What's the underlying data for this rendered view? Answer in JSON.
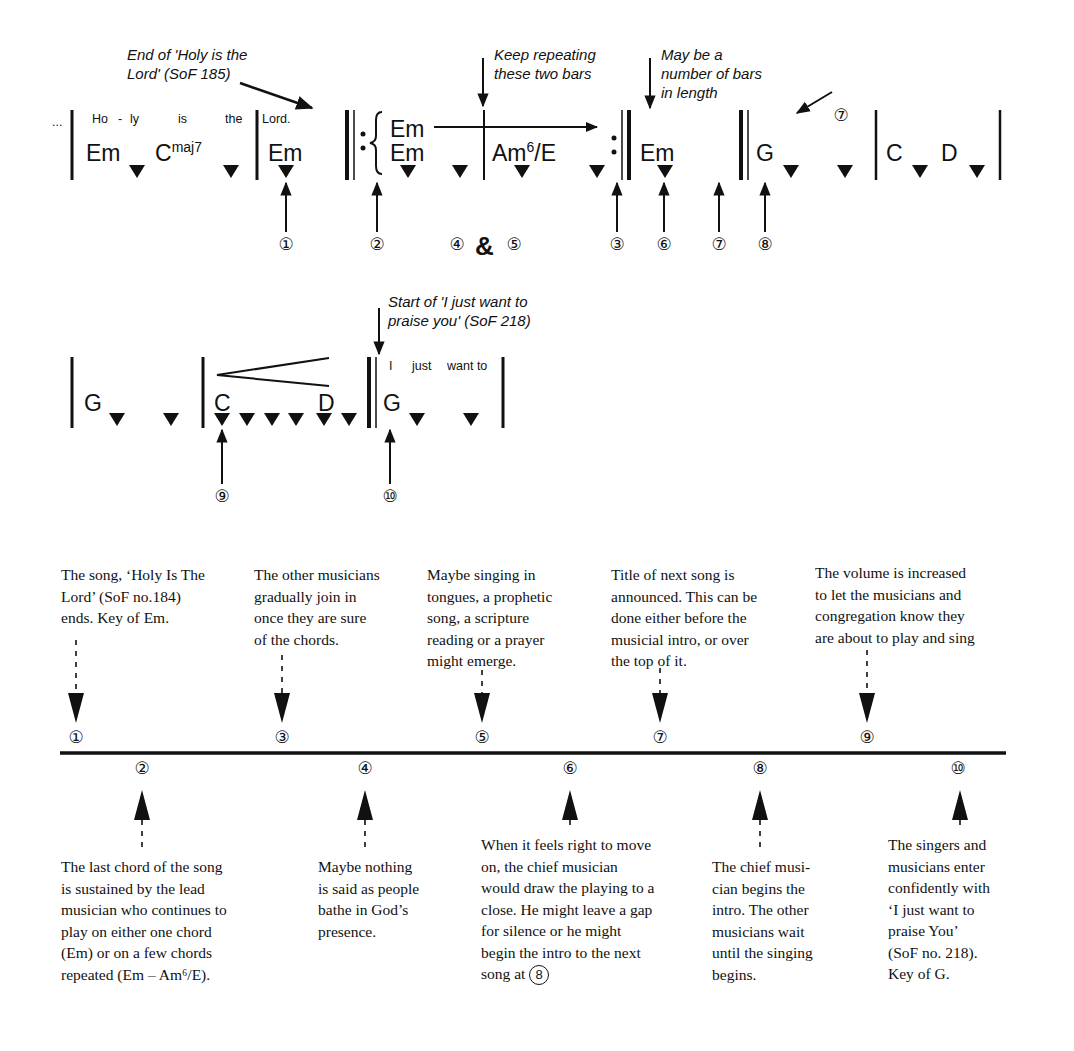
{
  "diagram": {
    "notation": {
      "row1": {
        "ellipsis": "...",
        "lyrics": [
          "Ho",
          "-",
          "ly",
          "is",
          "the",
          "Lord."
        ],
        "chords": {
          "em1": "Em",
          "cmaj7_root": "C",
          "cmaj7_ext": "maj7",
          "em2": "Em",
          "repeat_em_top": "Em",
          "repeat_em_bottom": "Em",
          "am6e_root": "Am",
          "am6e_sup": "6",
          "am6e_bass": "/E",
          "em3": "Em",
          "g": "G",
          "c": "C",
          "d": "D"
        },
        "annotations": {
          "end_holy_line1": "End of 'Holy is the",
          "end_holy_line2": "Lord' (SoF 185)",
          "keep_line1": "Keep repeating",
          "keep_line2": "these two bars",
          "may_line1": "May be a",
          "may_line2": "number of bars",
          "may_line3": "in length"
        },
        "markers": {
          "m1": "①",
          "m2": "②",
          "m4": "④",
          "amp": "&",
          "m5": "⑤",
          "m3": "③",
          "m6": "⑥",
          "m7": "⑦",
          "m8": "⑧",
          "m7_top": "⑦"
        }
      },
      "row2": {
        "chords": {
          "g1": "G",
          "c": "C",
          "d": "D",
          "g2": "G"
        },
        "lyrics": [
          "I",
          "just",
          "want to"
        ],
        "annotations": {
          "start_line1": "Start of 'I just want to",
          "start_line2": "praise you' (SoF 218)"
        },
        "markers": {
          "m9": "⑨",
          "m10": "⑩"
        }
      }
    },
    "timeline": {
      "points": [
        {
          "marker": "①",
          "position": "above",
          "text": "The song, ‘Holy Is The\nLord’ (SoF no.184)\nends. Key of Em."
        },
        {
          "marker": "②",
          "position": "below",
          "text": "The last chord of the song\nis sustained by the lead\nmusician who continues to\nplay on either one chord\n(Em) or on a few chords\nrepeated (Em – Am⁶/E)."
        },
        {
          "marker": "③",
          "position": "above",
          "text": "The other musicians\ngradually join in\nonce they are sure\nof the chords."
        },
        {
          "marker": "④",
          "position": "below",
          "text": "Maybe nothing\nis said as people\nbathe in God’s\npresence."
        },
        {
          "marker": "⑤",
          "position": "above",
          "text": "Maybe singing in\ntongues, a prophetic\nsong, a scripture\nreading or a prayer\nmight emerge."
        },
        {
          "marker": "⑥",
          "position": "below",
          "text": "When it feels right to move\non, the chief musician\nwould draw the playing to a\nclose. He might leave a gap\nfor silence or he might\nbegin the intro to the next\nsong at ",
          "trailing_marker": "8"
        },
        {
          "marker": "⑦",
          "position": "above",
          "text": "Title of next song is\nannounced. This can be\ndone either before the\nmusicial intro, or over\nthe top of it."
        },
        {
          "marker": "⑧",
          "position": "below",
          "text": "The chief musi-\ncian begins the\nintro. The other\nmusicians wait\nuntil the singing\nbegins."
        },
        {
          "marker": "⑨",
          "position": "above",
          "text": "The volume is increased\nto let the musicians and\ncongregation know they\nare about to play and sing"
        },
        {
          "marker": "⑩",
          "position": "below",
          "text": "The singers and\nmusicians enter\nconfidently with\n‘I just want to\npraise You’\n(SoF no. 218).\nKey of G."
        }
      ]
    }
  }
}
